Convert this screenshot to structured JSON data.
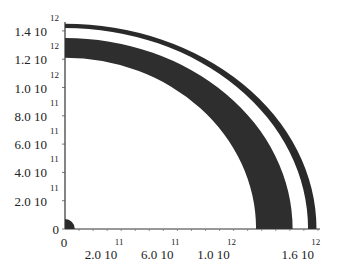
{
  "chart_data": {
    "type": "area",
    "title": "",
    "xlabel": "",
    "ylabel": "",
    "xlim": [
      0,
      1800000000000.0
    ],
    "ylim": [
      0,
      1480000000000.0
    ],
    "grid": false,
    "legend": null,
    "x_ticks": [
      {
        "value": 0,
        "mantissa": "0",
        "exponent": ""
      },
      {
        "value": 200000000000.0,
        "mantissa": "2.0 10",
        "exponent": "11"
      },
      {
        "value": 600000000000.0,
        "mantissa": "6.0 10",
        "exponent": "11"
      },
      {
        "value": 1000000000000.0,
        "mantissa": "1.0 10",
        "exponent": "12"
      },
      {
        "value": 1600000000000.0,
        "mantissa": "1.6 10",
        "exponent": "12"
      }
    ],
    "y_ticks": [
      {
        "value": 0,
        "mantissa": "0",
        "exponent": ""
      },
      {
        "value": 200000000000.0,
        "mantissa": "2.0 10",
        "exponent": "11"
      },
      {
        "value": 400000000000.0,
        "mantissa": "4.0 10",
        "exponent": "11"
      },
      {
        "value": 600000000000.0,
        "mantissa": "6.0 10",
        "exponent": "11"
      },
      {
        "value": 800000000000.0,
        "mantissa": "8.0 10",
        "exponent": "11"
      },
      {
        "value": 1000000000000.0,
        "mantissa": "1.0 10",
        "exponent": "12"
      },
      {
        "value": 1200000000000.0,
        "mantissa": "1.2 10",
        "exponent": "12"
      },
      {
        "value": 1400000000000.0,
        "mantissa": "1.4 10",
        "exponent": "12"
      }
    ],
    "regions": [
      {
        "name": "core",
        "fill": "#2a2a2a",
        "outer_x": 70000000000.0,
        "outer_y": 70000000000.0,
        "inner_x": 0,
        "inner_y": 0
      },
      {
        "name": "inner-band",
        "fill": "#2e2e2e",
        "inner_x": 1360000000000.0,
        "inner_y": 1210000000000.0,
        "outer_x": 1620000000000.0,
        "outer_y": 1350000000000.0
      },
      {
        "name": "outer-band",
        "fill": "#2a2a2a",
        "inner_x": 1730000000000.0,
        "inner_y": 1420000000000.0,
        "outer_x": 1790000000000.0,
        "outer_y": 1450000000000.0
      }
    ]
  },
  "colors": {
    "background": "#ffffff",
    "band": "#2c2c2c",
    "axis": "#333333"
  }
}
